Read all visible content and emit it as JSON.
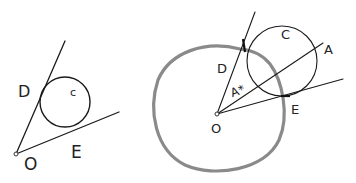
{
  "left_figure": {
    "labels": {
      "D": "D",
      "C": "c",
      "O": "O",
      "E": "E"
    }
  },
  "right_figure": {
    "labels": {
      "D": "D",
      "A_star": "A*",
      "C": "C",
      "A": "A",
      "E": "E",
      "O": "O"
    },
    "blob_color": "#888888"
  }
}
